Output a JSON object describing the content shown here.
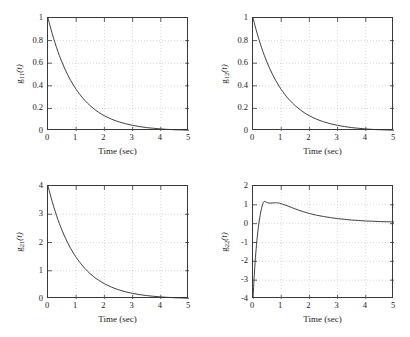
{
  "figure": {
    "background": "#ffffff",
    "curve_color": "#2b2b2b",
    "grid_color": "#b9b9b9",
    "axis_color": "#3a3a3a"
  },
  "chart_data": [
    {
      "type": "line",
      "id": "g11",
      "title": "",
      "xlabel": "Time (sec)",
      "ylabel_main": "g",
      "ylabel_sub": "11",
      "ylabel_arg": "(t)",
      "ylabel": "g11(t)",
      "xlim": [
        0,
        5
      ],
      "ylim": [
        0,
        1
      ],
      "xticks": [
        "0",
        "1",
        "2",
        "3",
        "4",
        "5"
      ],
      "xtick_values": [
        0,
        1,
        2,
        3,
        4,
        5
      ],
      "yticks": [
        "0",
        "0.2",
        "0.4",
        "0.6",
        "0.8",
        "1"
      ],
      "ytick_values": [
        0,
        0.2,
        0.4,
        0.6,
        0.8,
        1
      ],
      "grid": true,
      "legend": "none",
      "x": [
        0,
        0.1,
        0.2,
        0.3,
        0.4,
        0.5,
        0.6,
        0.7,
        0.8,
        0.9,
        1,
        1.2,
        1.4,
        1.6,
        1.8,
        2,
        2.25,
        2.5,
        2.75,
        3,
        3.25,
        3.5,
        3.75,
        4,
        4.25,
        4.5,
        4.75,
        5
      ],
      "values": [
        1,
        0.905,
        0.819,
        0.741,
        0.67,
        0.607,
        0.549,
        0.497,
        0.449,
        0.407,
        0.368,
        0.301,
        0.247,
        0.202,
        0.165,
        0.135,
        0.105,
        0.082,
        0.064,
        0.05,
        0.039,
        0.03,
        0.024,
        0.018,
        0.014,
        0.011,
        0.009,
        0.007
      ]
    },
    {
      "type": "line",
      "id": "g12",
      "title": "",
      "xlabel": "Time (sec)",
      "ylabel_main": "g",
      "ylabel_sub": "12",
      "ylabel_arg": "(t)",
      "ylabel": "g12(t)",
      "xlim": [
        0,
        5
      ],
      "ylim": [
        0,
        1
      ],
      "xticks": [
        "0",
        "1",
        "2",
        "3",
        "4",
        "5"
      ],
      "xtick_values": [
        0,
        1,
        2,
        3,
        4,
        5
      ],
      "yticks": [
        "0",
        "0.2",
        "0.4",
        "0.6",
        "0.8",
        "1"
      ],
      "ytick_values": [
        0,
        0.2,
        0.4,
        0.6,
        0.8,
        1
      ],
      "grid": true,
      "legend": "none",
      "x": [
        0,
        0.1,
        0.2,
        0.3,
        0.4,
        0.5,
        0.6,
        0.7,
        0.8,
        0.9,
        1,
        1.2,
        1.4,
        1.6,
        1.8,
        2,
        2.25,
        2.5,
        2.75,
        3,
        3.25,
        3.5,
        3.75,
        4,
        4.25,
        4.5,
        4.75,
        5
      ],
      "values": [
        1,
        0.905,
        0.819,
        0.741,
        0.67,
        0.607,
        0.549,
        0.497,
        0.449,
        0.407,
        0.368,
        0.301,
        0.247,
        0.202,
        0.165,
        0.135,
        0.105,
        0.082,
        0.064,
        0.05,
        0.039,
        0.03,
        0.024,
        0.018,
        0.014,
        0.011,
        0.009,
        0.007
      ]
    },
    {
      "type": "line",
      "id": "g21",
      "title": "",
      "xlabel": "Time (sec)",
      "ylabel_main": "g",
      "ylabel_sub": "21",
      "ylabel_arg": "(t)",
      "ylabel": "g21(t)",
      "xlim": [
        0,
        5
      ],
      "ylim": [
        0,
        4
      ],
      "xticks": [
        "0",
        "1",
        "2",
        "3",
        "4",
        "5"
      ],
      "xtick_values": [
        0,
        1,
        2,
        3,
        4,
        5
      ],
      "yticks": [
        "0",
        "1",
        "2",
        "3",
        "4"
      ],
      "ytick_values": [
        0,
        1,
        2,
        3,
        4
      ],
      "grid": true,
      "legend": "none",
      "x": [
        0,
        0.1,
        0.2,
        0.3,
        0.4,
        0.5,
        0.6,
        0.7,
        0.8,
        0.9,
        1,
        1.2,
        1.4,
        1.6,
        1.8,
        2,
        2.25,
        2.5,
        2.75,
        3,
        3.25,
        3.5,
        3.75,
        4,
        4.25,
        4.5,
        4.75,
        5
      ],
      "values": [
        4,
        3.621,
        3.277,
        2.965,
        2.681,
        2.426,
        2.195,
        1.986,
        1.797,
        1.627,
        1.472,
        1.205,
        0.986,
        0.807,
        0.661,
        0.541,
        0.421,
        0.328,
        0.255,
        0.199,
        0.155,
        0.121,
        0.094,
        0.073,
        0.057,
        0.044,
        0.035,
        0.027
      ]
    },
    {
      "type": "line",
      "id": "g22",
      "title": "",
      "xlabel": "Time (sec)",
      "ylabel_main": "g",
      "ylabel_sub": "22",
      "ylabel_arg": "(t)",
      "ylabel": "g22(t)",
      "xlim": [
        0,
        5
      ],
      "ylim": [
        -4,
        2
      ],
      "xticks": [
        "0",
        "1",
        "2",
        "3",
        "4",
        "5"
      ],
      "xtick_values": [
        0,
        1,
        2,
        3,
        4,
        5
      ],
      "yticks": [
        "-4",
        "-3",
        "-2",
        "-1",
        "0",
        "1",
        "2"
      ],
      "ytick_values": [
        -4,
        -3,
        -2,
        -1,
        0,
        1,
        2
      ],
      "grid": true,
      "legend": "none",
      "x": [
        0,
        0.05,
        0.1,
        0.15,
        0.2,
        0.25,
        0.3,
        0.35,
        0.4,
        0.5,
        0.6,
        0.7,
        0.8,
        0.85,
        0.9,
        1,
        1.1,
        1.25,
        1.5,
        1.75,
        2,
        2.25,
        2.5,
        2.75,
        3,
        3.25,
        3.5,
        3.75,
        4,
        4.25,
        4.5,
        4.75,
        5
      ],
      "values": [
        -4,
        -2.62,
        -1.55,
        -0.72,
        -0.07,
        0.42,
        0.79,
        1.06,
        1.18,
        1.12,
        1.09,
        1.1,
        1.11,
        1.11,
        1.1,
        1.06,
        1.01,
        0.93,
        0.78,
        0.65,
        0.54,
        0.45,
        0.38,
        0.32,
        0.27,
        0.23,
        0.19,
        0.17,
        0.14,
        0.13,
        0.11,
        0.1,
        0.09
      ]
    }
  ]
}
